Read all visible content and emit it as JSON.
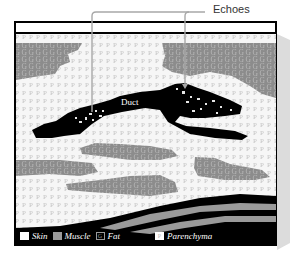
{
  "diagram": {
    "labels": {
      "echoes": "Echoes",
      "duct": "Duct"
    },
    "legend": [
      {
        "key": "skin",
        "label": "Skin",
        "swatch_glyph": ""
      },
      {
        "key": "muscle",
        "label": "Muscle",
        "swatch_glyph": ""
      },
      {
        "key": "fat",
        "label": "Fat",
        "swatch_glyph": "G"
      },
      {
        "key": "parenchyma",
        "label": "Parenchyma",
        "swatch_glyph": "P"
      }
    ],
    "colors": {
      "frame": "#000000",
      "parenchyma_bg": "#f4f4f4",
      "parenchyma_glyph": "#c8c8c8",
      "fat": "#8f8f8f",
      "muscle": "#9a9a9a",
      "duct": "#000000",
      "leader": "#a0a0a0",
      "shadow": "#d9d9d9"
    },
    "pattern_glyphs": {
      "parenchyma": "P",
      "fat": "G"
    }
  }
}
